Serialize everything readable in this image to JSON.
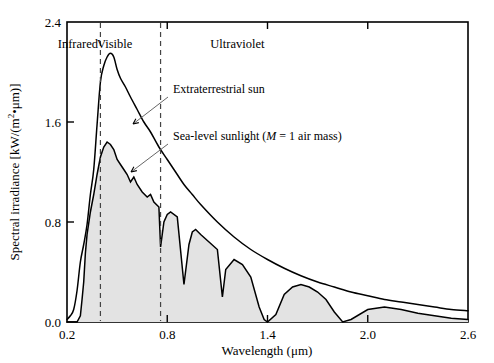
{
  "chart_data": {
    "type": "area",
    "title": "",
    "xlabel": "Wavelength (μm)",
    "ylabel": "Spectral irradiance [kW/(m²•μm)]",
    "xlim": [
      0.2,
      2.6
    ],
    "ylim": [
      0.0,
      2.4
    ],
    "xticks": [
      0.2,
      0.8,
      1.4,
      2.0,
      2.6
    ],
    "xtick_labels": [
      "0.2",
      "0.8",
      "1.4",
      "2.0",
      "2.6"
    ],
    "yticks": [
      0.0,
      0.8,
      1.6,
      2.4
    ],
    "ytick_labels": [
      "0.0",
      "0.8",
      "1.6",
      "2.4"
    ],
    "grid": false,
    "legend_position": "inline-annotations",
    "fill_color": "#e3e3e3",
    "line_color": "#000000",
    "region_markers": [
      {
        "label": "Infrared",
        "x_center": 0.265,
        "boundary_right": 0.4
      },
      {
        "label": "Visible",
        "x_center": 0.485,
        "boundary_right": 0.76
      },
      {
        "label": "Ultraviolet",
        "x_center": 1.22,
        "boundary_right": null
      }
    ],
    "dashed_boundaries": [
      0.4,
      0.76
    ],
    "series": [
      {
        "name": "Extraterrestrial sun",
        "style": "smooth-envelope",
        "x": [
          0.2,
          0.22,
          0.24,
          0.26,
          0.28,
          0.3,
          0.32,
          0.34,
          0.36,
          0.38,
          0.4,
          0.42,
          0.44,
          0.46,
          0.48,
          0.5,
          0.52,
          0.55,
          0.58,
          0.62,
          0.66,
          0.7,
          0.75,
          0.8,
          0.85,
          0.9,
          0.95,
          1.0,
          1.1,
          1.2,
          1.3,
          1.4,
          1.5,
          1.6,
          1.7,
          1.8,
          1.9,
          2.0,
          2.1,
          2.2,
          2.3,
          2.4,
          2.5,
          2.6
        ],
        "y": [
          0.02,
          0.05,
          0.1,
          0.25,
          0.48,
          0.62,
          0.78,
          1.02,
          1.22,
          1.58,
          1.92,
          2.05,
          2.12,
          2.15,
          2.12,
          2.02,
          1.95,
          1.88,
          1.8,
          1.7,
          1.6,
          1.52,
          1.4,
          1.3,
          1.2,
          1.1,
          1.02,
          0.94,
          0.8,
          0.68,
          0.58,
          0.5,
          0.43,
          0.37,
          0.32,
          0.28,
          0.24,
          0.21,
          0.18,
          0.16,
          0.14,
          0.12,
          0.1,
          0.09
        ]
      },
      {
        "name": "Sea-level sunlight (M = 1 air mass)",
        "style": "jagged-filled",
        "x": [
          0.2,
          0.26,
          0.28,
          0.29,
          0.3,
          0.31,
          0.32,
          0.34,
          0.36,
          0.38,
          0.4,
          0.42,
          0.44,
          0.46,
          0.48,
          0.5,
          0.52,
          0.54,
          0.56,
          0.58,
          0.6,
          0.62,
          0.65,
          0.68,
          0.7,
          0.72,
          0.75,
          0.76,
          0.78,
          0.8,
          0.82,
          0.86,
          0.9,
          0.93,
          0.95,
          0.97,
          1.0,
          1.05,
          1.1,
          1.13,
          1.15,
          1.2,
          1.25,
          1.3,
          1.35,
          1.38,
          1.4,
          1.45,
          1.5,
          1.55,
          1.6,
          1.65,
          1.7,
          1.75,
          1.8,
          1.85,
          1.9,
          2.0,
          2.1,
          2.2,
          2.3,
          2.4,
          2.5,
          2.6
        ],
        "y": [
          0.0,
          0.0,
          0.05,
          0.18,
          0.32,
          0.55,
          0.7,
          0.88,
          1.02,
          1.18,
          1.32,
          1.4,
          1.44,
          1.42,
          1.38,
          1.3,
          1.26,
          1.22,
          1.18,
          1.12,
          1.16,
          1.1,
          1.04,
          1.0,
          1.02,
          0.96,
          0.92,
          0.6,
          0.8,
          0.86,
          0.88,
          0.84,
          0.3,
          0.62,
          0.72,
          0.74,
          0.7,
          0.64,
          0.58,
          0.2,
          0.42,
          0.5,
          0.46,
          0.36,
          0.12,
          0.02,
          0.0,
          0.06,
          0.22,
          0.28,
          0.3,
          0.28,
          0.24,
          0.18,
          0.08,
          0.0,
          0.02,
          0.1,
          0.12,
          0.1,
          0.07,
          0.05,
          0.03,
          0.02
        ]
      }
    ],
    "annotations": [
      {
        "text": "Extraterrestrial sun",
        "label_x_px": 173,
        "label_y_px": 93,
        "arrow_from_px": [
          168,
          97
        ],
        "arrow_to_px": [
          133,
          124
        ]
      },
      {
        "text_parts": [
          "Sea-level sunlight (",
          "M",
          " = 1 air mass)"
        ],
        "text": "Sea-level sunlight (M = 1 air mass)",
        "label_x_px": 173,
        "label_y_px": 140,
        "arrow_from_px": [
          168,
          144
        ],
        "arrow_to_px": [
          131,
          172
        ]
      }
    ]
  }
}
